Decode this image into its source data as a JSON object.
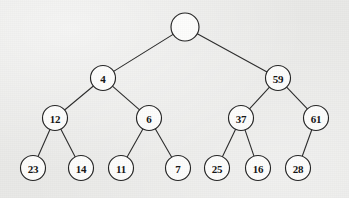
{
  "diagram": {
    "background_color": "#e9e9e7",
    "node_fill_color": "#fdfdfc",
    "node_stroke_color": "#242424",
    "edge_color": "#2c2c2c",
    "label_color": "#141414"
  },
  "chart_data": {
    "type": "diagram",
    "subtype": "binary-tree",
    "nodes": [
      {
        "id": "root",
        "label": "",
        "cx": 185,
        "cy": 27,
        "r": 14,
        "level": 0
      },
      {
        "id": "n4",
        "label": "4",
        "cx": 103,
        "cy": 78,
        "r": 12.5,
        "level": 1
      },
      {
        "id": "n59",
        "label": "59",
        "cx": 278,
        "cy": 78,
        "r": 12.5,
        "level": 1
      },
      {
        "id": "n12",
        "label": "12",
        "cx": 55,
        "cy": 118,
        "r": 12.5,
        "level": 2
      },
      {
        "id": "n6",
        "label": "6",
        "cx": 149,
        "cy": 118,
        "r": 12.5,
        "level": 2
      },
      {
        "id": "n37",
        "label": "37",
        "cx": 241,
        "cy": 118,
        "r": 12.5,
        "level": 2
      },
      {
        "id": "n61",
        "label": "61",
        "cx": 316,
        "cy": 118,
        "r": 12.5,
        "level": 2
      },
      {
        "id": "n23",
        "label": "23",
        "cx": 33,
        "cy": 168,
        "r": 12.5,
        "level": 3
      },
      {
        "id": "n14",
        "label": "14",
        "cx": 81,
        "cy": 168,
        "r": 12.5,
        "level": 3
      },
      {
        "id": "n11",
        "label": "11",
        "cx": 121,
        "cy": 168,
        "r": 12.5,
        "level": 3
      },
      {
        "id": "n7",
        "label": "7",
        "cx": 178,
        "cy": 168,
        "r": 12.5,
        "level": 3
      },
      {
        "id": "n25",
        "label": "25",
        "cx": 217,
        "cy": 168,
        "r": 12.5,
        "level": 3
      },
      {
        "id": "n16",
        "label": "16",
        "cx": 258,
        "cy": 168,
        "r": 12.5,
        "level": 3
      },
      {
        "id": "n28",
        "label": "28",
        "cx": 298,
        "cy": 168,
        "r": 12.5,
        "level": 3
      }
    ],
    "edges": [
      {
        "from": "root",
        "to": "n4",
        "side": "left"
      },
      {
        "from": "root",
        "to": "n59",
        "side": "right"
      },
      {
        "from": "n4",
        "to": "n12",
        "side": "left"
      },
      {
        "from": "n4",
        "to": "n6",
        "side": "right"
      },
      {
        "from": "n59",
        "to": "n37",
        "side": "left"
      },
      {
        "from": "n59",
        "to": "n61",
        "side": "right"
      },
      {
        "from": "n12",
        "to": "n23",
        "side": "left"
      },
      {
        "from": "n12",
        "to": "n14",
        "side": "right"
      },
      {
        "from": "n6",
        "to": "n11",
        "side": "left"
      },
      {
        "from": "n6",
        "to": "n7",
        "side": "right"
      },
      {
        "from": "n37",
        "to": "n25",
        "side": "left"
      },
      {
        "from": "n37",
        "to": "n16",
        "side": "right"
      },
      {
        "from": "n61",
        "to": "n28",
        "side": "left"
      }
    ],
    "title": "",
    "xlabel": "",
    "ylabel": ""
  }
}
